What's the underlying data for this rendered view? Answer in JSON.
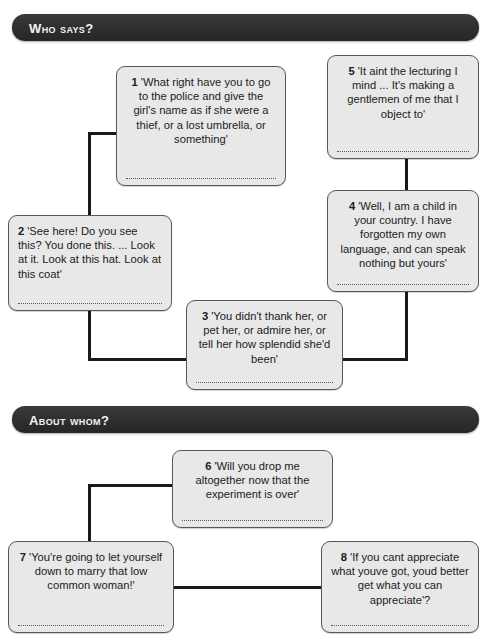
{
  "sections": [
    {
      "id": "who-says",
      "title": "Who says?",
      "boxes": [
        {
          "num": "1",
          "quote": "'What right have you to go to the police and give the girl's name as if she were a thief, or a lost umbrella, or something'",
          "align": "center"
        },
        {
          "num": "5",
          "quote": "'It aint the lecturing I mind ... It's making a gentlemen of me that I object to'",
          "align": "center"
        },
        {
          "num": "2",
          "quote": "'See here! Do you see this? You done this. ... Look at it. Look at this hat. Look at this coat'",
          "align": "left"
        },
        {
          "num": "4",
          "quote": "'Well, I am a child in your country. I have forgotten my own language, and can speak nothing but yours'",
          "align": "center"
        },
        {
          "num": "3",
          "quote": "'You didn't thank her, or pet her, or admire her, or tell her how splendid she'd been'",
          "align": "center"
        }
      ]
    },
    {
      "id": "about-whom",
      "title": "About whom?",
      "boxes": [
        {
          "num": "6",
          "quote": "'Will you drop me altogether now that the experiment is over'",
          "align": "center"
        },
        {
          "num": "7",
          "quote": "'You're going to let yourself down to marry that low common woman!'",
          "align": "center"
        },
        {
          "num": "8",
          "quote": "'If you cant appreciate what youve got, youd better get what you can appreciate'?",
          "align": "center"
        }
      ]
    }
  ],
  "colors": {
    "header_bar": "#2e2e2e",
    "header_text": "#f2f2f2",
    "box_fill": "#e8e8e8",
    "box_border": "#585858",
    "connector": "#1a1a1a",
    "page_background": "#ffffff"
  }
}
